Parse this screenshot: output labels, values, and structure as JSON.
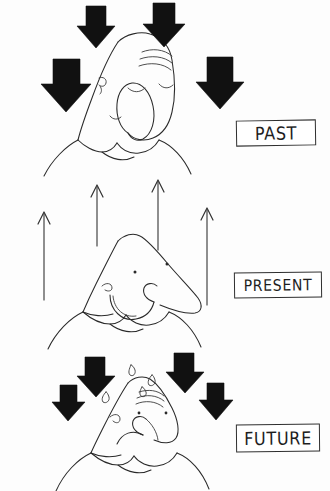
{
  "image": {
    "title": "Past Present Future",
    "medium": "hand-drawn ink cartoon",
    "width": 330,
    "height": 491,
    "background_color": "#fdfdfd",
    "ink_color": "#2a2a2a",
    "arrow_fill_color": "#111111"
  },
  "panels": [
    {
      "id": "past",
      "label": "PAST",
      "label_box": {
        "x": 236,
        "y": 120,
        "width": 80,
        "height": 26
      },
      "mood": "weary-eyes-closed",
      "arrow_direction": "down",
      "arrow_style": "solid-black-block",
      "arrow_count": 4,
      "arrows": [
        {
          "x": 41,
          "y": 59,
          "width": 50,
          "height": 53
        },
        {
          "x": 77,
          "y": 6,
          "width": 38,
          "height": 42
        },
        {
          "x": 143,
          "y": 3,
          "width": 42,
          "height": 44
        },
        {
          "x": 196,
          "y": 57,
          "width": 48,
          "height": 52
        }
      ]
    },
    {
      "id": "present",
      "label": "PRESENT",
      "label_box": {
        "x": 234,
        "y": 272,
        "width": 88,
        "height": 26
      },
      "mood": "smiling",
      "arrow_direction": "up",
      "arrow_style": "thin-line",
      "arrow_count": 4,
      "arrows": [
        {
          "x": 44,
          "y_top": 212,
          "y_bottom": 300
        },
        {
          "x": 97,
          "y_top": 185,
          "y_bottom": 246
        },
        {
          "x": 158,
          "y_top": 180,
          "y_bottom": 250
        },
        {
          "x": 207,
          "y_top": 208,
          "y_bottom": 305
        }
      ]
    },
    {
      "id": "future",
      "label": "FUTURE",
      "label_box": {
        "x": 236,
        "y": 424,
        "width": 84,
        "height": 28
      },
      "mood": "worried-sweating-frown",
      "arrow_direction": "down",
      "arrow_style": "solid-black-block",
      "arrow_count": 4,
      "arrows": [
        {
          "x": 77,
          "y": 357,
          "width": 38,
          "height": 40
        },
        {
          "x": 166,
          "y": 353,
          "width": 38,
          "height": 40
        },
        {
          "x": 52,
          "y": 385,
          "width": 33,
          "height": 36
        },
        {
          "x": 199,
          "y": 383,
          "width": 34,
          "height": 37
        }
      ]
    }
  ],
  "figure_details": {
    "past": {
      "eyes": "closed arcs",
      "brow": "three curved worry lines on forehead",
      "mouth": "small downturned curve",
      "ear": "curved hook on cheek",
      "shoulders": "V-neck collar with rounded shoulders"
    },
    "present": {
      "eyes": "two small dots",
      "eyebrow": "single small hook",
      "mouth": "wide upturned smile",
      "nose": "long pointed triangular profile",
      "shoulders": "V-neck collar with rounded shoulders"
    },
    "future": {
      "eyes": "dots under furrowed brow",
      "brow": "multiple squiggly stress lines",
      "mouth": "downturned frown",
      "sweat_drops": 4,
      "shoulders": "V-neck collar with rounded shoulders"
    }
  },
  "labels": {
    "past": "PAST",
    "present": "PRESENT",
    "future": "FUTURE"
  }
}
